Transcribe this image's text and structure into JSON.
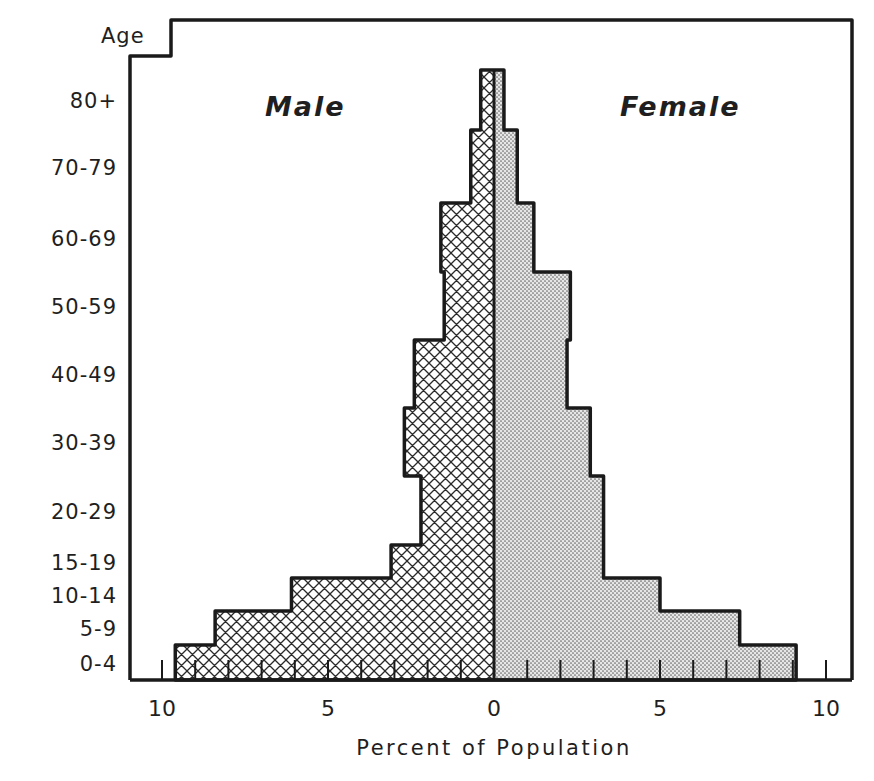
{
  "chart_data": {
    "type": "bar",
    "subtype": "population-pyramid",
    "title": "",
    "xlabel": "Percent of Population",
    "ylabel": "Age",
    "xlim": [
      -10,
      10
    ],
    "x_tick_labels": [
      "10",
      "5",
      "0",
      "5",
      "10"
    ],
    "x_tick_values": [
      -10,
      -5,
      0,
      5,
      10
    ],
    "minor_tick_step": 1,
    "legend": [
      {
        "name": "Male",
        "pattern": "crosshatch",
        "side": "left"
      },
      {
        "name": "Female",
        "pattern": "stipple",
        "side": "right"
      }
    ],
    "categories": [
      "80+",
      "70-79",
      "60-69",
      "50-59",
      "40-49",
      "30-39",
      "20-29",
      "15-19",
      "10-14",
      "5-9",
      "0-4"
    ],
    "series": [
      {
        "name": "Male",
        "values": [
          0.4,
          0.7,
          1.6,
          1.5,
          2.4,
          2.7,
          2.2,
          3.1,
          6.1,
          8.4,
          9.6
        ]
      },
      {
        "name": "Female",
        "values": [
          0.3,
          0.7,
          1.2,
          2.3,
          2.2,
          2.9,
          3.3,
          3.3,
          5.0,
          7.4,
          9.1
        ]
      }
    ],
    "grid": false
  },
  "labels": {
    "age_axis": "Age",
    "male": "Male",
    "female": "Female",
    "x_axis": "Percent of Population"
  }
}
